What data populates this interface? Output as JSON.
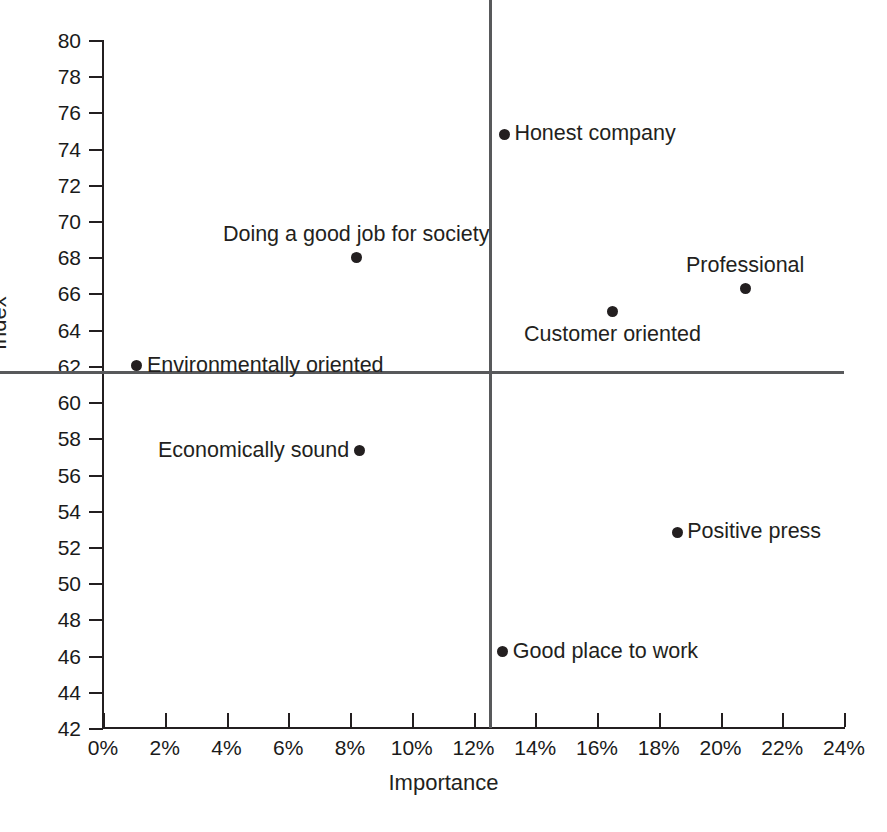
{
  "chart_data": {
    "type": "scatter",
    "title": "",
    "xlabel": "Importance",
    "ylabel": "Index",
    "xlim": [
      0,
      24
    ],
    "ylim": [
      42,
      80
    ],
    "grid": false,
    "legend": "none",
    "x_tick_labels": [
      "0%",
      "2%",
      "4%",
      "6%",
      "8%",
      "10%",
      "12%",
      "14%",
      "16%",
      "18%",
      "20%",
      "22%",
      "24%"
    ],
    "x_tick_values": [
      0,
      2,
      4,
      6,
      8,
      10,
      12,
      14,
      16,
      18,
      20,
      22,
      24
    ],
    "y_tick_labels": [
      "80",
      "78",
      "76",
      "74",
      "72",
      "70",
      "68",
      "66",
      "64",
      "62",
      "60",
      "58",
      "56",
      "54",
      "52",
      "50",
      "48",
      "46",
      "44",
      "42"
    ],
    "y_tick_values": [
      80,
      78,
      76,
      74,
      72,
      70,
      68,
      66,
      64,
      62,
      60,
      58,
      56,
      54,
      52,
      50,
      48,
      46,
      44,
      42
    ],
    "reference_lines": {
      "vertical_x": 12.5,
      "horizontal_y": 61.7
    },
    "points": [
      {
        "label": "Honest company",
        "x": 13.0,
        "y": 74.8,
        "label_pos": "right"
      },
      {
        "label": "Doing a good job for society",
        "x": 8.2,
        "y": 68.0,
        "label_pos": "above"
      },
      {
        "label": "Professional",
        "x": 20.8,
        "y": 66.3,
        "label_pos": "above"
      },
      {
        "label": "Customer oriented",
        "x": 16.5,
        "y": 65.0,
        "label_pos": "below"
      },
      {
        "label": "Environmentally oriented",
        "x": 1.1,
        "y": 62.0,
        "label_pos": "right"
      },
      {
        "label": "Economically sound",
        "x": 8.3,
        "y": 57.3,
        "label_pos": "left"
      },
      {
        "label": "Positive press",
        "x": 18.6,
        "y": 52.8,
        "label_pos": "right"
      },
      {
        "label": "Good place to work",
        "x": 12.95,
        "y": 46.2,
        "label_pos": "right"
      }
    ]
  },
  "colors": {
    "point": "#231f20",
    "axis": "#231f20",
    "quadrant_line": "#58595b",
    "background": "#ffffff",
    "text": "#231f20"
  }
}
